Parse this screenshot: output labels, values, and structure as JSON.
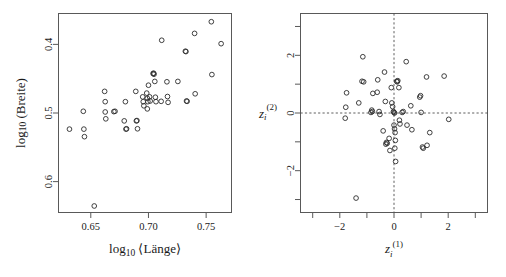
{
  "figure": {
    "background": "#ffffff",
    "marker_color": "#2b2b2b",
    "frame_color": "#595959",
    "guide_color": "#4d4d4d"
  },
  "panels": {
    "left": {
      "name": "length-width-scatter",
      "xlabel": "log",
      "xlabel_sub": "10",
      "xlabel_rest": "⟨Länge⟩",
      "ylabel": "log",
      "ylabel_sub": "10",
      "ylabel_rest": "(Breite)",
      "xticks": [
        "0.65",
        "0.70",
        "0.75"
      ],
      "yticks": [
        "0.6",
        "0.5",
        "0.4"
      ]
    },
    "right": {
      "name": "standardized-residual-scatter",
      "xlabel_main": "z",
      "xlabel_sub": "i",
      "xlabel_sup": "(1)",
      "ylabel_main": "z",
      "ylabel_sub": "i",
      "ylabel_sup": "(2)",
      "xticks": [
        "−2",
        "0",
        "2"
      ],
      "yticks": [
        "2",
        "0",
        "−2"
      ]
    }
  },
  "chart_data": [
    {
      "type": "scatter",
      "title": "",
      "panel": "left",
      "xlabel": "log10 ⟨Länge⟩",
      "ylabel": "log10 (Breite)",
      "xlim": [
        0.622,
        0.772
      ],
      "ylim": [
        0.355,
        0.645
      ],
      "xticks": [
        0.65,
        0.7,
        0.75
      ],
      "yticks": [
        0.4,
        0.5,
        0.6
      ],
      "grid": false,
      "legend": null,
      "marker": "open-circle",
      "points": [
        [
          0.6315,
          0.4765
        ],
        [
          0.6435,
          0.5025
        ],
        [
          0.644,
          0.4765
        ],
        [
          0.6445,
          0.4655
        ],
        [
          0.653,
          0.3645
        ],
        [
          0.662,
          0.5315
        ],
        [
          0.6625,
          0.5165
        ],
        [
          0.6625,
          0.5015
        ],
        [
          0.663,
          0.4915
        ],
        [
          0.67,
          0.502
        ],
        [
          0.671,
          0.5025
        ],
        [
          0.679,
          0.4885
        ],
        [
          0.68,
          0.5165
        ],
        [
          0.6805,
          0.4765
        ],
        [
          0.681,
          0.477
        ],
        [
          0.689,
          0.5315
        ],
        [
          0.6895,
          0.4885
        ],
        [
          0.69,
          0.489
        ],
        [
          0.6905,
          0.477
        ],
        [
          0.695,
          0.5235
        ],
        [
          0.6955,
          0.5165
        ],
        [
          0.696,
          0.5105
        ],
        [
          0.6985,
          0.529
        ],
        [
          0.699,
          0.5215
        ],
        [
          0.6995,
          0.5165
        ],
        [
          0.699,
          0.506
        ],
        [
          0.7,
          0.5405
        ],
        [
          0.701,
          0.5235
        ],
        [
          0.7015,
          0.5175
        ],
        [
          0.704,
          0.5575
        ],
        [
          0.7045,
          0.558
        ],
        [
          0.7048,
          0.5565
        ],
        [
          0.7055,
          0.546
        ],
        [
          0.706,
          0.523
        ],
        [
          0.7065,
          0.5165
        ],
        [
          0.711,
          0.517
        ],
        [
          0.7115,
          0.606
        ],
        [
          0.716,
          0.5455
        ],
        [
          0.7165,
          0.524
        ],
        [
          0.717,
          0.5155
        ],
        [
          0.7255,
          0.546
        ],
        [
          0.732,
          0.59
        ],
        [
          0.7325,
          0.5895
        ],
        [
          0.733,
          0.5175
        ],
        [
          0.7335,
          0.517
        ],
        [
          0.74,
          0.616
        ],
        [
          0.7405,
          0.528
        ],
        [
          0.7545,
          0.633
        ],
        [
          0.755,
          0.556
        ],
        [
          0.763,
          0.601
        ]
      ]
    },
    {
      "type": "scatter",
      "title": "",
      "panel": "right",
      "xlabel": "z_i^(1)",
      "ylabel": "z_i^(2)",
      "xlim": [
        -3.45,
        3.45
      ],
      "ylim": [
        -3.45,
        3.45
      ],
      "xticks": [
        -3,
        -2,
        -1,
        0,
        1,
        2,
        3
      ],
      "xtick_labels": [
        "",
        "-2",
        "",
        "0",
        "",
        "2",
        ""
      ],
      "yticks": [
        -3,
        -2,
        -1,
        0,
        1,
        2,
        3
      ],
      "ytick_labels": [
        "",
        "-2",
        "",
        "0",
        "",
        "2",
        ""
      ],
      "grid": false,
      "reference_lines": {
        "vertical_x": 0,
        "horizontal_y": 0,
        "style": "dashed"
      },
      "legend": null,
      "marker": "open-circle",
      "points": [
        [
          -1.4,
          -2.95
        ],
        [
          -1.75,
          0.7
        ],
        [
          -1.78,
          0.2
        ],
        [
          -1.8,
          -0.18
        ],
        [
          -1.15,
          1.95
        ],
        [
          -1.18,
          1.1
        ],
        [
          -1.12,
          1.08
        ],
        [
          -1.3,
          0.35
        ],
        [
          -0.78,
          0.68
        ],
        [
          -0.82,
          0.1
        ],
        [
          -0.8,
          0.05
        ],
        [
          -0.85,
          0.02
        ],
        [
          -0.62,
          0.72
        ],
        [
          -0.6,
          1.15
        ],
        [
          -0.55,
          0.05
        ],
        [
          -0.52,
          -0.05
        ],
        [
          -0.4,
          -0.62
        ],
        [
          -0.35,
          1.42
        ],
        [
          -0.32,
          0.4
        ],
        [
          -0.28,
          -1.02
        ],
        [
          -0.3,
          -1.08
        ],
        [
          -0.25,
          -1.05
        ],
        [
          -0.18,
          -0.88
        ],
        [
          -0.15,
          -1.3
        ],
        [
          -0.1,
          0.88
        ],
        [
          -0.08,
          0.35
        ],
        [
          -0.05,
          0.22
        ],
        [
          -0.02,
          0.05
        ],
        [
          0.0,
          0.02
        ],
        [
          0.02,
          0.0
        ],
        [
          0.0,
          -0.42
        ],
        [
          0.02,
          -0.55
        ],
        [
          0.04,
          -0.68
        ],
        [
          0.05,
          -0.95
        ],
        [
          0.03,
          -1.22
        ],
        [
          0.06,
          -1.68
        ],
        [
          0.1,
          1.1
        ],
        [
          0.14,
          1.12
        ],
        [
          0.12,
          1.08
        ],
        [
          0.18,
          0.88
        ],
        [
          0.2,
          -0.25
        ],
        [
          0.22,
          -0.38
        ],
        [
          0.3,
          0.02
        ],
        [
          0.34,
          0.05
        ],
        [
          0.45,
          1.78
        ],
        [
          0.48,
          -0.42
        ],
        [
          0.62,
          0.25
        ],
        [
          0.66,
          -0.58
        ],
        [
          0.95,
          0.55
        ],
        [
          0.98,
          0.6
        ],
        [
          1.0,
          0.02
        ],
        [
          1.05,
          -1.18
        ],
        [
          1.08,
          -1.22
        ],
        [
          1.22,
          -1.12
        ],
        [
          1.2,
          1.25
        ],
        [
          1.32,
          -0.68
        ],
        [
          1.85,
          1.28
        ],
        [
          2.02,
          -0.22
        ]
      ]
    }
  ]
}
